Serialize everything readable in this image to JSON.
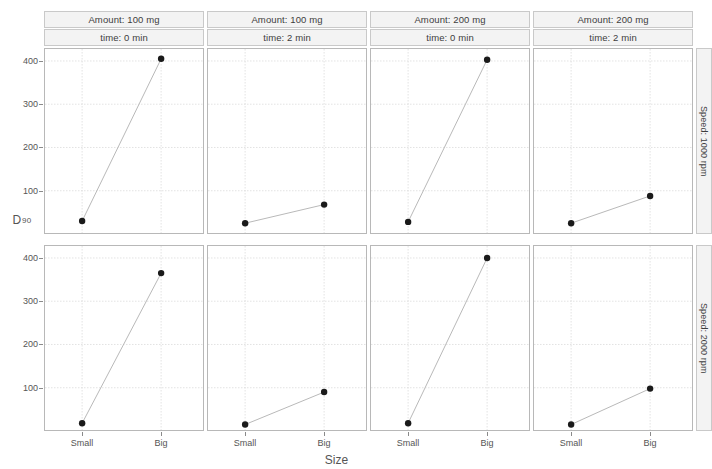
{
  "chart_data": {
    "type": "line",
    "title": "",
    "xlabel": "Size",
    "ylabel": "D90",
    "ylabel_base": "D",
    "ylabel_sub": "90",
    "categories": [
      "Small",
      "Big"
    ],
    "ylim": [
      0,
      430
    ],
    "yticks": [
      100,
      200,
      300,
      400
    ],
    "ytick_labels": [
      "100",
      "200",
      "300",
      "400"
    ],
    "grid": true,
    "legend": "none",
    "facet_col_var": [
      "Amount",
      "time"
    ],
    "facet_row_var": "Speed",
    "row_labels": [
      "Speed: 1000 rpm",
      "Speed: 2000 rpm"
    ],
    "col_labels_top": [
      "Amount: 100 mg",
      "Amount: 100 mg",
      "Amount: 200 mg",
      "Amount: 200 mg"
    ],
    "col_labels_bottom": [
      "time: 0 min",
      "time: 2 min",
      "time: 0 min",
      "time: 2 min"
    ],
    "panels": [
      {
        "row": 0,
        "col": 0,
        "amount": "100 mg",
        "time": "0 min",
        "speed": "1000 rpm",
        "strip_top": "Amount: 100 mg",
        "strip_bottom": "time: 0 min",
        "values": [
          30,
          405
        ]
      },
      {
        "row": 0,
        "col": 1,
        "amount": "100 mg",
        "time": "2 min",
        "speed": "1000 rpm",
        "strip_top": "Amount: 100 mg",
        "strip_bottom": "time: 2 min",
        "values": [
          25,
          68
        ]
      },
      {
        "row": 0,
        "col": 2,
        "amount": "200 mg",
        "time": "0 min",
        "speed": "1000 rpm",
        "strip_top": "Amount: 200 mg",
        "strip_bottom": "time: 0 min",
        "values": [
          28,
          403
        ]
      },
      {
        "row": 0,
        "col": 3,
        "amount": "200 mg",
        "time": "2 min",
        "speed": "1000 rpm",
        "strip_top": "Amount: 200 mg",
        "strip_bottom": "time: 2 min",
        "values": [
          25,
          88
        ]
      },
      {
        "row": 1,
        "col": 0,
        "amount": "100 mg",
        "time": "0 min",
        "speed": "2000 rpm",
        "strip_top": "Amount: 100 mg",
        "strip_bottom": "time: 0 min",
        "values": [
          18,
          365
        ]
      },
      {
        "row": 1,
        "col": 1,
        "amount": "100 mg",
        "time": "2 min",
        "speed": "2000 rpm",
        "strip_top": "Amount: 100 mg",
        "strip_bottom": "time: 2 min",
        "values": [
          15,
          90
        ]
      },
      {
        "row": 1,
        "col": 2,
        "amount": "200 mg",
        "time": "0 min",
        "speed": "2000 rpm",
        "strip_top": "Amount: 200 mg",
        "strip_bottom": "time: 0 min",
        "values": [
          18,
          400
        ]
      },
      {
        "row": 1,
        "col": 3,
        "amount": "200 mg",
        "time": "2 min",
        "speed": "2000 rpm",
        "strip_top": "Amount: 200 mg",
        "strip_bottom": "time: 2 min",
        "values": [
          15,
          98
        ]
      }
    ],
    "colors": {
      "point": "#1a1a1a",
      "line": "#b9b9b9",
      "grid": "#dcdcdc",
      "panel_border": "#b8b8b8",
      "strip_bg": "#f3f3f3",
      "strip_border": "#c9c9c9",
      "text": "#555555",
      "background": "#ffffff"
    }
  }
}
